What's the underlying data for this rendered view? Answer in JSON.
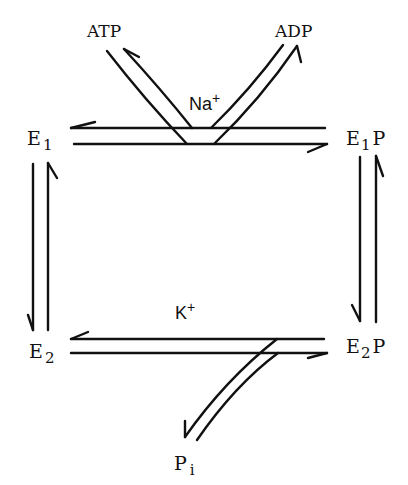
{
  "diagram": {
    "type": "reaction-cycle",
    "states": {
      "e1": {
        "base": "E",
        "sub": "1",
        "suffix": ""
      },
      "e1p": {
        "base": "E",
        "sub": "1",
        "suffix": "P"
      },
      "e2p": {
        "base": "E",
        "sub": "2",
        "suffix": "P"
      },
      "e2": {
        "base": "E",
        "sub": "2",
        "suffix": ""
      }
    },
    "substrates": {
      "atp": "ATP",
      "adp": "ADP",
      "pi_base": "P",
      "pi_sub": "i"
    },
    "ions": {
      "na": {
        "base": "Na",
        "sup": "+"
      },
      "k": {
        "base": "K",
        "sup": "+"
      }
    },
    "transitions": [
      {
        "from": "E1",
        "to": "E1P",
        "reversible": true,
        "inputs": [
          "ATP"
        ],
        "outputs": [
          "ADP"
        ],
        "ion": "Na+"
      },
      {
        "from": "E1P",
        "to": "E2P",
        "reversible": true
      },
      {
        "from": "E2P",
        "to": "E2",
        "reversible": true,
        "outputs": [
          "Pi"
        ],
        "ion": "K+"
      },
      {
        "from": "E2",
        "to": "E1",
        "reversible": true
      }
    ]
  }
}
